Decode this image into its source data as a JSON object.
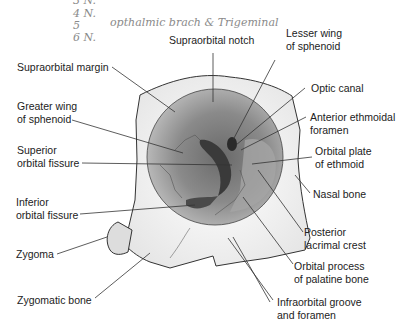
{
  "handwritten_notes": {
    "line3": "3 N.",
    "line4": "4 N.",
    "line5": "5",
    "line5_note": "opthalmic brach & Trigeminal",
    "line6": "6 N."
  },
  "labels": {
    "supraorbital_notch": "Supraorbital notch",
    "lesser_wing_1": "Lesser wing",
    "lesser_wing_2": "of sphenoid",
    "supraorbital_margin": "Supraorbital margin",
    "optic_canal": "Optic canal",
    "greater_wing_1": "Greater wing",
    "greater_wing_2": "of sphenoid",
    "anterior_ethmoidal_1": "Anterior ethmoidal",
    "anterior_ethmoidal_2": "foramen",
    "superior_fissure_1": "Superior",
    "superior_fissure_2": "orbital fissure",
    "orbital_plate_1": "Orbital plate",
    "orbital_plate_2": "of ethmoid",
    "nasal_bone": "Nasal bone",
    "inferior_fissure_1": "Inferior",
    "inferior_fissure_2": "orbital fissure",
    "posterior_lacrimal_1": "Posterior",
    "posterior_lacrimal_2": "lacrimal crest",
    "zygoma": "Zygoma",
    "orbital_process_1": "Orbital process",
    "orbital_process_2": "of palatine bone",
    "zygomatic_bone": "Zygomatic bone",
    "infraorbital_1": "Infraorbital groove",
    "infraorbital_2": "and foramen"
  }
}
